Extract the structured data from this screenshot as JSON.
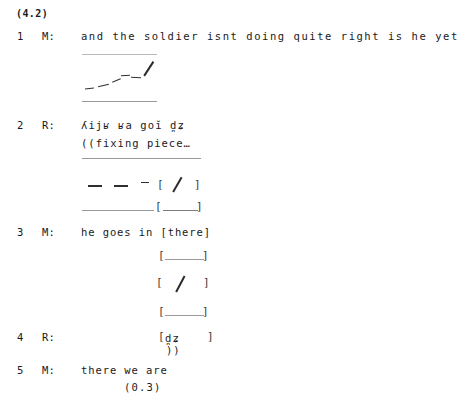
{
  "extract": {
    "id": "(4.2)"
  },
  "turns": [
    {
      "number": "1",
      "speaker": "M:",
      "text": "and the soldier isnt doing quite right is he yet"
    },
    {
      "number": "2",
      "speaker": "R:",
      "ipa": "ʎijʁ ʁa goĭ d̪ʑ",
      "comment": "((fixing piece…"
    },
    {
      "number": "3",
      "speaker": "M:",
      "text": "he goes in [there]"
    },
    {
      "number": "4",
      "speaker": "R:",
      "ipa": "d̪ʑ",
      "comment": "))"
    },
    {
      "number": "5",
      "speaker": "M:",
      "text": "there we are",
      "pause": "(0.3)"
    }
  ],
  "notation": {
    "bracket_open": "[",
    "bracket_close": "]",
    "slash": "/",
    "em_dash": "—",
    "en_dash": "–",
    "hyphen": "-"
  },
  "colors": {
    "text": "#1a1a1a",
    "staff": "#b9b9b9",
    "stroke": "#2b2b2b",
    "bracket": "#3a3a3a",
    "background": "#ffffff"
  }
}
